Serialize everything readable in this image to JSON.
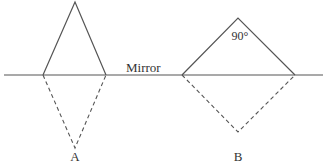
{
  "diagram": {
    "mirror_label": "Mirror",
    "angle_label": "90°",
    "label_a": "A",
    "label_b": "B",
    "colors": {
      "line": "#555555",
      "text": "#333333",
      "background": "#ffffff"
    }
  }
}
